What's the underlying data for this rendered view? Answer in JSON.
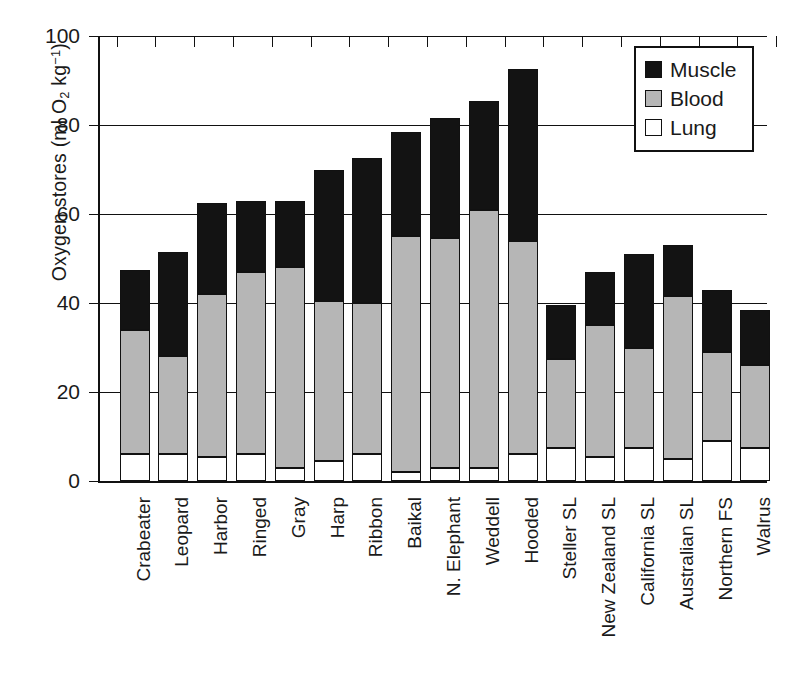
{
  "chart_data": {
    "type": "bar",
    "subtype": "stacked-vertical",
    "title": "",
    "xlabel": "",
    "ylabel": "Oxygen stores (ml O2 kg-1)",
    "ylabel_parts": {
      "prefix": "Oxygen stores (ml O",
      "sub": "2",
      "mid": " kg",
      "sup": "−1",
      "suffix": ")"
    },
    "ylim": [
      0,
      100
    ],
    "yticks": [
      0,
      20,
      40,
      60,
      80,
      100
    ],
    "ytick_labels": [
      "0",
      "20",
      "40",
      "60",
      "80",
      "100"
    ],
    "grid": "horizontal",
    "legend_position": "top-right",
    "categories": [
      "Crabeater",
      "Leopard",
      "Harbor",
      "Ringed",
      "Gray",
      "Harp",
      "Ribbon",
      "Baikal",
      "N. Elephant",
      "Weddell",
      "Hooded",
      "Steller SL",
      "New Zealand SL",
      "California SL",
      "Australian SL",
      "Northern FS",
      "Walrus"
    ],
    "series": [
      {
        "name": "Lung",
        "color": "#ffffff",
        "values": [
          6.0,
          6.0,
          5.5,
          6.0,
          3.0,
          4.5,
          6.0,
          2.0,
          3.0,
          3.0,
          6.0,
          7.5,
          5.5,
          7.5,
          5.0,
          9.0,
          7.5
        ]
      },
      {
        "name": "Blood",
        "color": "#b6b6b6",
        "values": [
          28.0,
          22.0,
          36.5,
          41.0,
          45.0,
          36.0,
          34.0,
          53.0,
          51.5,
          58.0,
          48.0,
          20.0,
          29.5,
          22.5,
          36.5,
          20.0,
          18.5
        ]
      },
      {
        "name": "Muscle",
        "color": "#131313",
        "values": [
          13.5,
          23.5,
          20.5,
          16.0,
          15.0,
          29.5,
          32.5,
          23.5,
          27.0,
          24.5,
          38.5,
          12.0,
          12.0,
          21.0,
          11.5,
          14.0,
          12.5
        ]
      }
    ],
    "cumulative_tops": {
      "lung": [
        6.0,
        6.0,
        5.5,
        6.0,
        3.0,
        4.5,
        6.0,
        2.0,
        3.0,
        3.0,
        6.0,
        7.5,
        5.5,
        7.5,
        5.0,
        9.0,
        7.5
      ],
      "blood": [
        34.0,
        28.0,
        42.0,
        47.0,
        48.0,
        40.5,
        40.0,
        55.0,
        54.5,
        61.0,
        54.0,
        27.5,
        35.0,
        30.0,
        41.5,
        29.0,
        26.0
      ],
      "muscle": [
        47.5,
        51.5,
        62.5,
        63.0,
        63.0,
        70.0,
        72.5,
        78.5,
        81.5,
        85.5,
        92.5,
        39.5,
        47.0,
        51.0,
        53.0,
        43.0,
        38.5
      ]
    },
    "totals": [
      47.5,
      51.5,
      62.5,
      63.0,
      63.0,
      70.0,
      72.5,
      78.5,
      81.5,
      85.5,
      92.5,
      39.5,
      47.0,
      51.0,
      53.0,
      43.0,
      38.5
    ]
  },
  "legend": {
    "items": [
      {
        "label": "Muscle",
        "color": "#131313"
      },
      {
        "label": "Blood",
        "color": "#b6b6b6"
      },
      {
        "label": "Lung",
        "color": "#ffffff"
      }
    ]
  },
  "colors": {
    "muscle": "#131313",
    "blood": "#b6b6b6",
    "lung": "#ffffff",
    "axis": "#111111",
    "background": "#ffffff"
  }
}
